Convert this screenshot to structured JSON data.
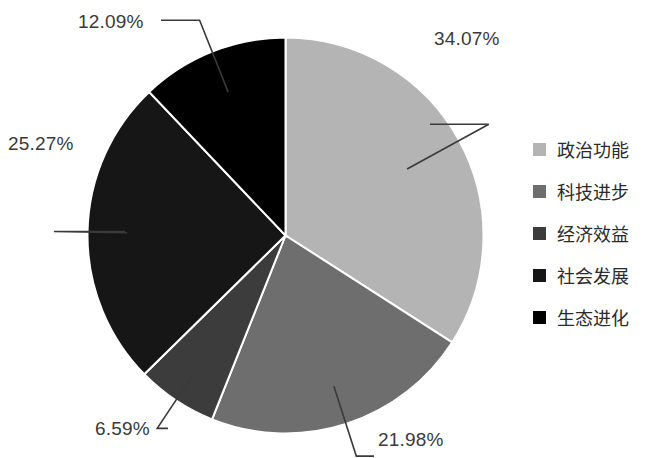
{
  "chart_data": {
    "type": "pie",
    "title": "",
    "categories": [
      "政治功能",
      "科技进步",
      "经济效益",
      "社会发展",
      "生态进化"
    ],
    "values": [
      34.07,
      21.98,
      6.59,
      25.27,
      12.09
    ],
    "value_labels": [
      "34.07%",
      "21.98%",
      "6.59%",
      "25.27%",
      "12.09%"
    ],
    "unit": "%",
    "colors": [
      "#b4b4b4",
      "#6e6e6e",
      "#3c3c3c",
      "#161616",
      "#000000"
    ],
    "legend_position": "right",
    "grid": false,
    "start_angle": 0,
    "direction": "clockwise",
    "slice_border_color": "#ffffff",
    "label_color": "#3a3a3a",
    "background": "#ffffff"
  },
  "labels": {
    "slice_0": "34.07%",
    "slice_1": "21.98%",
    "slice_2": "6.59%",
    "slice_3": "25.27%",
    "slice_4": "12.09%"
  },
  "legend": {
    "items": [
      {
        "label": "政治功能",
        "color": "#b4b4b4"
      },
      {
        "label": "科技进步",
        "color": "#6e6e6e"
      },
      {
        "label": "经济效益",
        "color": "#3c3c3c"
      },
      {
        "label": "社会发展",
        "color": "#161616"
      },
      {
        "label": "生态进化",
        "color": "#000000"
      }
    ]
  }
}
